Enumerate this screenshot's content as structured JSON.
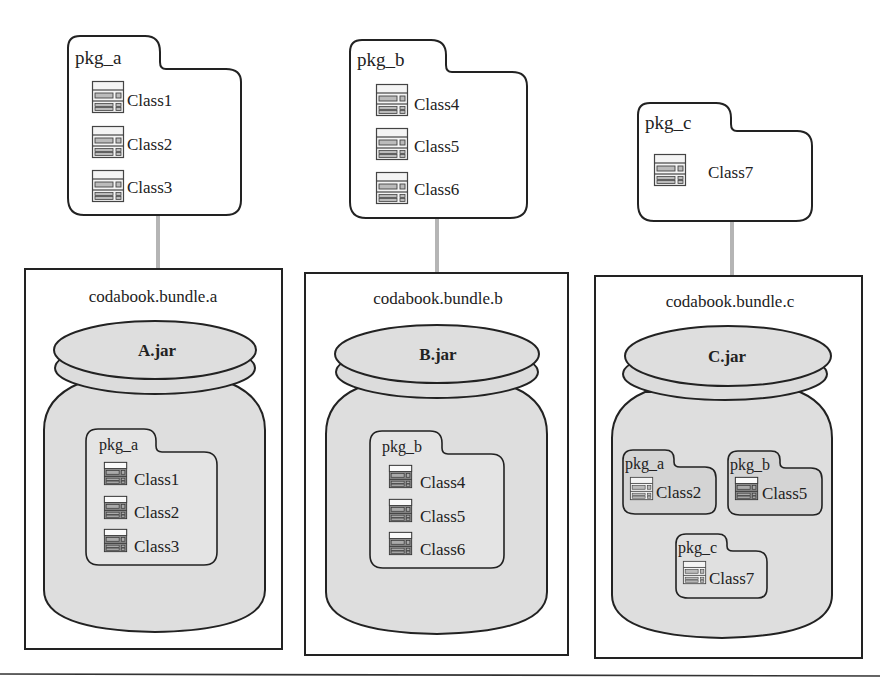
{
  "colors": {
    "stroke": "#222222",
    "connector": "#b0b0b0",
    "jar_fill": "#dedede",
    "inner_pkg_fill": "#e2e2e2",
    "inner_pkg_fill_c": "#d2d2d2",
    "background": "#ffffff"
  },
  "packages": [
    {
      "name": "pkg_a",
      "classes": [
        "Class1",
        "Class2",
        "Class3"
      ]
    },
    {
      "name": "pkg_b",
      "classes": [
        "Class4",
        "Class5",
        "Class6"
      ]
    },
    {
      "name": "pkg_c",
      "classes": [
        "Class7"
      ]
    }
  ],
  "bundles": [
    {
      "name": "codabook.bundle.a",
      "jar": "A.jar",
      "contents": [
        {
          "name": "pkg_a",
          "classes": [
            "Class1",
            "Class2",
            "Class3"
          ]
        }
      ]
    },
    {
      "name": "codabook.bundle.b",
      "jar": "B.jar",
      "contents": [
        {
          "name": "pkg_b",
          "classes": [
            "Class4",
            "Class5",
            "Class6"
          ]
        }
      ]
    },
    {
      "name": "codabook.bundle.c",
      "jar": "C.jar",
      "contents": [
        {
          "name": "pkg_a",
          "classes": [
            "Class2"
          ]
        },
        {
          "name": "pkg_b",
          "classes": [
            "Class5"
          ]
        },
        {
          "name": "pkg_c",
          "classes": [
            "Class7"
          ]
        }
      ]
    }
  ]
}
